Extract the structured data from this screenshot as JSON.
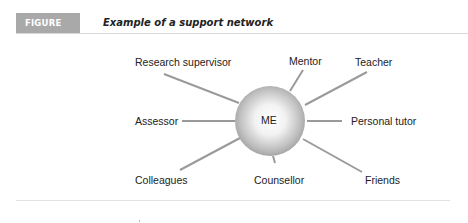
{
  "figure": {
    "tag": "FIGURE 2.5",
    "title": "Example of a support network"
  },
  "diagram": {
    "center": {
      "label": "ME",
      "x": 270,
      "y": 121,
      "r": 35
    },
    "line_color": "#9a9a9a",
    "nodes": [
      {
        "label": "Research supervisor",
        "x1": 164,
        "y1": 74,
        "x2": 239,
        "y2": 103,
        "lx": 135,
        "ly": 56
      },
      {
        "label": "Mentor",
        "x1": 303,
        "y1": 70,
        "x2": 290,
        "y2": 91,
        "lx": 289,
        "ly": 55
      },
      {
        "label": "Teacher",
        "x1": 367,
        "y1": 72,
        "x2": 305,
        "y2": 105,
        "lx": 355,
        "ly": 56
      },
      {
        "label": "Assessor",
        "x1": 182,
        "y1": 121,
        "x2": 235,
        "y2": 121,
        "lx": 135,
        "ly": 115
      },
      {
        "label": "Personal tutor",
        "x1": 307,
        "y1": 121,
        "x2": 342,
        "y2": 121,
        "lx": 351,
        "ly": 115
      },
      {
        "label": "Colleagues",
        "x1": 180,
        "y1": 170,
        "x2": 240,
        "y2": 138,
        "lx": 135,
        "ly": 174
      },
      {
        "label": "Counsellor",
        "x1": 275,
        "y1": 163,
        "x2": 273,
        "y2": 156,
        "lx": 254,
        "ly": 174
      },
      {
        "label": "Friends",
        "x1": 362,
        "y1": 172,
        "x2": 303,
        "y2": 139,
        "lx": 365,
        "ly": 174
      }
    ]
  }
}
